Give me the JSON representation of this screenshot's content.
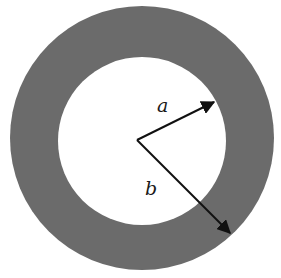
{
  "diagram": {
    "title": "",
    "shape": "annulus",
    "colors": {
      "ring": "#6b6b6b",
      "background": "#ffffff",
      "arrow": "#111111"
    },
    "labels": {
      "inner_radius": "a",
      "outer_radius": "b"
    }
  }
}
